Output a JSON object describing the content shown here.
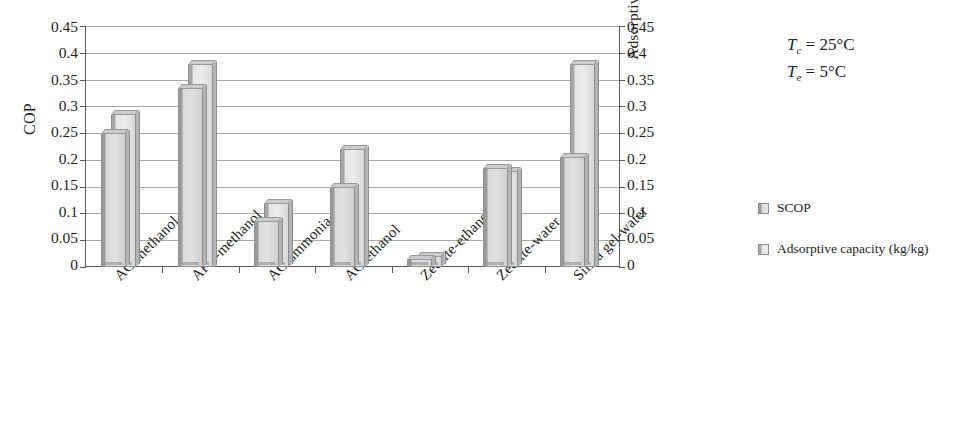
{
  "chart_data": {
    "type": "bar",
    "title": "",
    "categories": [
      "AC-methanol",
      "AFC-methanol",
      "AC-ammonia",
      "AC-ethanol",
      "Zeolite-ethanol",
      "Zeolite-water",
      "Silica gel-water"
    ],
    "series": [
      {
        "name": "SCOP",
        "values": [
          0.25,
          0.335,
          0.085,
          0.15,
          0.015,
          0.185,
          0.205
        ]
      },
      {
        "name": "Adsorptive capacity (kg/kg)",
        "values": [
          0.285,
          0.38,
          0.12,
          0.22,
          0.02,
          0.18,
          0.38
        ]
      }
    ],
    "xlabel": "",
    "ylabel": "COP",
    "y2label": "Adsorptive capacity (kg/kg)",
    "ylim": [
      0,
      0.45
    ],
    "y2lim": [
      0,
      0.45
    ],
    "yticks": [
      "0",
      "0.05",
      "0.1",
      "0.15",
      "0.2",
      "0.25",
      "0.3",
      "0.35",
      "0.4",
      "0.45"
    ],
    "y2ticks": [
      "0",
      "0.05",
      "0.1",
      "0.15",
      "0.2",
      "0.25",
      "0.3",
      "0.35",
      "0.4",
      "0.45"
    ],
    "grid": true,
    "legend_position": "right",
    "annotations": [
      "Tc = 25°C",
      "Te = 5°C"
    ]
  },
  "axes": {
    "left_title": "COP",
    "right_title": "Adsorptive capacity (kg/kg)",
    "tick_labels": [
      "0.45",
      "0.4",
      "0.35",
      "0.3",
      "0.25",
      "0.2",
      "0.15",
      "0.1",
      "0.05",
      "0"
    ]
  },
  "categories": [
    "AC-methanol",
    "AFC-methanol",
    "AC-ammonia",
    "AC-ethanol",
    "Zeolite-ethanol",
    "Zeolite-water",
    "Silica gel-water"
  ],
  "legend": {
    "items": [
      {
        "label": "SCOP"
      },
      {
        "label": "Adsorptive capacity (kg/kg)"
      }
    ]
  },
  "annotations": {
    "condenser": {
      "symbol": "T",
      "sub": "c",
      "value": " = 25°C"
    },
    "evaporator": {
      "symbol": "T",
      "sub": "e",
      "value": " = 5°C"
    }
  }
}
